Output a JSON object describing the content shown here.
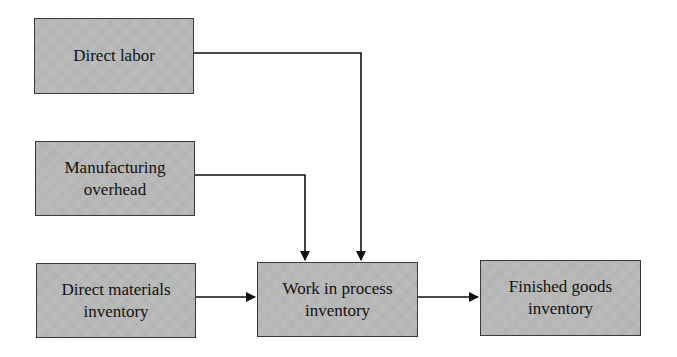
{
  "diagram": {
    "title": "",
    "type": "flowchart",
    "colors": {
      "box_fill": "#b9b9b9",
      "box_border": "#3a3a3a",
      "line": "#111111",
      "text": "#111111"
    },
    "nodes": [
      {
        "id": "direct-labor",
        "label": "Direct labor"
      },
      {
        "id": "manufacturing-overhead",
        "label": "Manufacturing overhead"
      },
      {
        "id": "direct-materials-inventory",
        "label": "Direct materials inventory"
      },
      {
        "id": "work-in-process-inventory",
        "label": "Work in process inventory"
      },
      {
        "id": "finished-goods-inventory",
        "label": "Finished goods inventory"
      }
    ],
    "edges": [
      {
        "from": "direct-labor",
        "to": "work-in-process-inventory"
      },
      {
        "from": "manufacturing-overhead",
        "to": "work-in-process-inventory"
      },
      {
        "from": "direct-materials-inventory",
        "to": "work-in-process-inventory"
      },
      {
        "from": "work-in-process-inventory",
        "to": "finished-goods-inventory"
      }
    ]
  },
  "labels": {
    "direct_labor": "Direct labor",
    "manufacturing_overhead_l1": "Manufacturing",
    "manufacturing_overhead_l2": "overhead",
    "direct_materials_l1": "Direct materials",
    "direct_materials_l2": "inventory",
    "wip_l1": "Work in process",
    "wip_l2": "inventory",
    "finished_goods_l1": "Finished goods",
    "finished_goods_l2": "inventory"
  }
}
